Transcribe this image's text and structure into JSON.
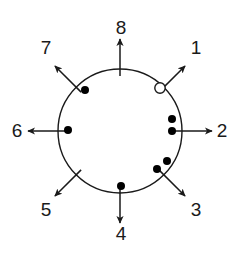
{
  "figure": {
    "background_color": "#ffffff",
    "stroke_color": "#1a1a1a",
    "marker_fill_color": "#000000",
    "marker_open_color": "#ffffff"
  },
  "maze": {
    "center": {
      "x": 120,
      "y": 131
    },
    "radius": 62,
    "circle_stroke_width": 1.4
  },
  "arms": [
    {
      "label": "1",
      "angle_deg": 45,
      "label_x": 196,
      "label_y": 48,
      "arrow_start_r": 55,
      "arrow_end_r": 92
    },
    {
      "label": "2",
      "angle_deg": 0,
      "label_x": 222,
      "label_y": 131,
      "arrow_start_r": 55,
      "arrow_end_r": 92
    },
    {
      "label": "3",
      "angle_deg": -45,
      "label_x": 196,
      "label_y": 210,
      "arrow_start_r": 55,
      "arrow_end_r": 92
    },
    {
      "label": "4",
      "angle_deg": -90,
      "label_x": 121,
      "label_y": 234,
      "arrow_start_r": 55,
      "arrow_end_r": 92
    },
    {
      "label": "5",
      "angle_deg": -135,
      "label_x": 46,
      "label_y": 210,
      "arrow_start_r": 55,
      "arrow_end_r": 92
    },
    {
      "label": "6",
      "angle_deg": 180,
      "label_x": 17,
      "label_y": 131,
      "arrow_start_r": 55,
      "arrow_end_r": 92
    },
    {
      "label": "7",
      "angle_deg": 135,
      "label_x": 46,
      "label_y": 48,
      "arrow_start_r": 55,
      "arrow_end_r": 92
    },
    {
      "label": "8",
      "angle_deg": 90,
      "label_x": 121,
      "label_y": 28,
      "arrow_start_r": 55,
      "arrow_end_r": 92
    }
  ],
  "markers": [
    {
      "name": "open-marker-arm-1",
      "x": 160,
      "y": 88,
      "r": 5.2,
      "filled": false
    },
    {
      "name": "filled-marker-arm-7",
      "x": 85,
      "y": 90,
      "r": 4.0,
      "filled": true
    },
    {
      "name": "filled-marker-arm-6",
      "x": 68,
      "y": 130,
      "r": 4.0,
      "filled": true
    },
    {
      "name": "filled-marker-arm-2-upper",
      "x": 172,
      "y": 119,
      "r": 4.0,
      "filled": true
    },
    {
      "name": "filled-marker-arm-2-lower",
      "x": 172,
      "y": 131,
      "r": 4.0,
      "filled": true
    },
    {
      "name": "filled-marker-arm-3-upper",
      "x": 167,
      "y": 161,
      "r": 4.0,
      "filled": true
    },
    {
      "name": "filled-marker-arm-3-lower",
      "x": 157,
      "y": 169,
      "r": 4.0,
      "filled": true
    },
    {
      "name": "filled-marker-arm-4",
      "x": 121,
      "y": 186,
      "r": 4.0,
      "filled": true
    }
  ]
}
